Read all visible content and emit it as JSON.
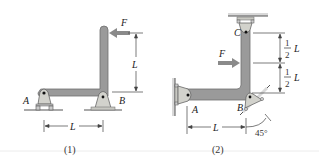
{
  "colors": {
    "member": "#9a9a9a",
    "member_edge": "#6f6f6f",
    "support": "#d2d2cc",
    "support_edge": "#666666",
    "ground": "#555555",
    "force_arrow": "#8a8a8a",
    "dim": "#444444",
    "caption_rule": "#e6e6e6"
  },
  "figure1": {
    "caption": "(1)",
    "force_label": "F",
    "point_a": "A",
    "point_b": "B",
    "vertical_dim": "L",
    "horizontal_dim": "L"
  },
  "figure2": {
    "caption": "(2)",
    "force_label": "F",
    "point_a": "A",
    "point_b": "B",
    "point_c": "C",
    "upper_dim_num": "1",
    "upper_dim_den": "2",
    "upper_dim_var": "L",
    "lower_dim_num": "1",
    "lower_dim_den": "2",
    "lower_dim_var": "L",
    "horizontal_dim": "L",
    "angle": "45°"
  }
}
